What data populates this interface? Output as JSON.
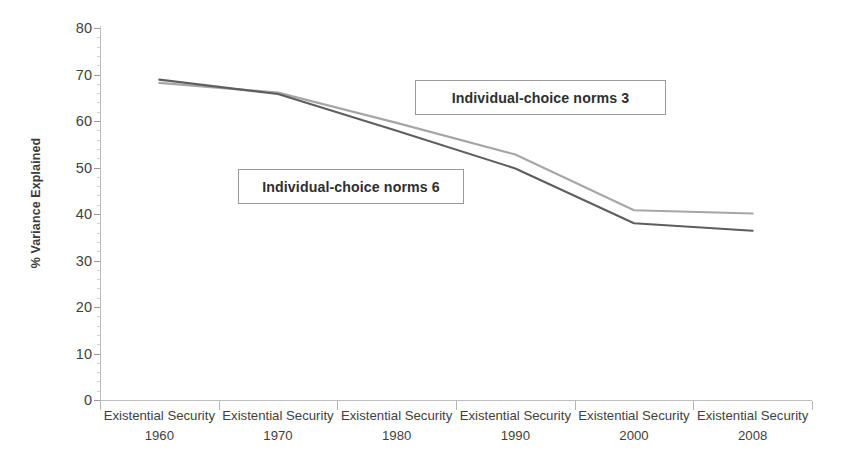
{
  "chart_data": {
    "type": "line",
    "title": "",
    "xlabel": "",
    "ylabel": "% Variance Explained",
    "categories": [
      "Existential Security 1960",
      "Existential Security 1970",
      "Existential Security 1980",
      "Existential Security 1990",
      "Existential Security 2000",
      "Existential Security 2008"
    ],
    "category_lines": [
      {
        "name": "Existential Security",
        "year": "1960"
      },
      {
        "name": "Existential Security",
        "year": "1970"
      },
      {
        "name": "Existential Security",
        "year": "1980"
      },
      {
        "name": "Existential Security",
        "year": "1990"
      },
      {
        "name": "Existential Security",
        "year": "2000"
      },
      {
        "name": "Existential Security",
        "year": "2008"
      }
    ],
    "series": [
      {
        "name": "Individual-choice norms 3",
        "color": "#a6a6a6",
        "values": [
          68.2,
          66.1,
          59.6,
          52.8,
          40.8,
          40.1
        ]
      },
      {
        "name": "Individual-choice norms 6",
        "color": "#5e5e5e",
        "values": [
          68.9,
          65.8,
          57.9,
          49.8,
          38.0,
          36.4
        ]
      }
    ],
    "ylim": [
      0,
      80
    ],
    "ytick_values": [
      0,
      10,
      20,
      30,
      40,
      50,
      60,
      70,
      80
    ],
    "ytick_labels": [
      "0",
      "10",
      "20",
      "30",
      "40",
      "50",
      "60",
      "70",
      "80"
    ],
    "grid": false,
    "legend_position": "inline-annotations",
    "annotations": [
      {
        "id": "annot-3",
        "text": "Individual-choice norms 3"
      },
      {
        "id": "annot-6",
        "text": "Individual-choice norms 6"
      }
    ]
  }
}
